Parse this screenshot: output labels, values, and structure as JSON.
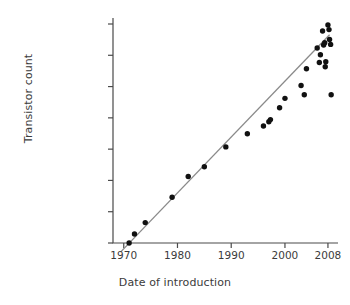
{
  "chart_data": {
    "type": "scatter",
    "title": "",
    "xlabel": "Date of introduction",
    "ylabel": "Transistor count",
    "xlim": [
      1968,
      2009.5
    ],
    "ylim": [
      2300,
      2000000000
    ],
    "yscale": "log",
    "grid": false,
    "legend": null,
    "x_ticks": [
      {
        "value": 1970,
        "label": "1970"
      },
      {
        "value": 1980,
        "label": "1980"
      },
      {
        "value": 1990,
        "label": "1990"
      },
      {
        "value": 2000,
        "label": "2000"
      },
      {
        "value": 2008,
        "label": "2008"
      }
    ],
    "y_ticks": [
      {
        "value": 2000000000,
        "label": "2,000,000,000"
      },
      {
        "value": 400000000,
        "label": ""
      },
      {
        "value": 100000000,
        "label": "100,000,000"
      },
      {
        "value": 10000000,
        "label": ""
      },
      {
        "value": 1000000,
        "label": "1,000,000"
      },
      {
        "value": 100000,
        "label": "100,000"
      },
      {
        "value": 10000,
        "label": "10,000"
      },
      {
        "value": 2300,
        "label": "2,300"
      }
    ],
    "points": [
      {
        "x": 1971.0,
        "y": 2300
      },
      {
        "x": 1972.0,
        "y": 3500
      },
      {
        "x": 1974.0,
        "y": 6000
      },
      {
        "x": 1979.0,
        "y": 29000
      },
      {
        "x": 1982.0,
        "y": 134000
      },
      {
        "x": 1985.0,
        "y": 275000
      },
      {
        "x": 1989.0,
        "y": 1180000
      },
      {
        "x": 1993.0,
        "y": 3100000
      },
      {
        "x": 1996.0,
        "y": 5500000
      },
      {
        "x": 1997.0,
        "y": 7500000
      },
      {
        "x": 1997.3,
        "y": 8800000
      },
      {
        "x": 1999.0,
        "y": 21000000
      },
      {
        "x": 2000.0,
        "y": 42000000
      },
      {
        "x": 2003.0,
        "y": 105000000
      },
      {
        "x": 2003.6,
        "y": 55000000
      },
      {
        "x": 2004.0,
        "y": 220000000
      },
      {
        "x": 2006.0,
        "y": 580000000
      },
      {
        "x": 2006.4,
        "y": 290000000
      },
      {
        "x": 2006.6,
        "y": 410000000
      },
      {
        "x": 2007.0,
        "y": 1400000000
      },
      {
        "x": 2007.2,
        "y": 680000000
      },
      {
        "x": 2007.4,
        "y": 760000000
      },
      {
        "x": 2007.5,
        "y": 240000000
      },
      {
        "x": 2007.6,
        "y": 300000000
      },
      {
        "x": 2008.0,
        "y": 1900000000
      },
      {
        "x": 2008.2,
        "y": 1500000000
      },
      {
        "x": 2008.3,
        "y": 900000000
      },
      {
        "x": 2008.5,
        "y": 700000000
      },
      {
        "x": 2008.6,
        "y": 55000000
      }
    ],
    "trend_line": {
      "label": "",
      "x_start": 1969.4,
      "y_start": 1500,
      "x_end": 2008.3,
      "y_end": 1150000000
    },
    "colors": {
      "point": "#111111",
      "trend": "#8a8a8a",
      "axis": "#4a4a4a",
      "text": "#3b3b3b",
      "background": "#ffffff"
    }
  }
}
